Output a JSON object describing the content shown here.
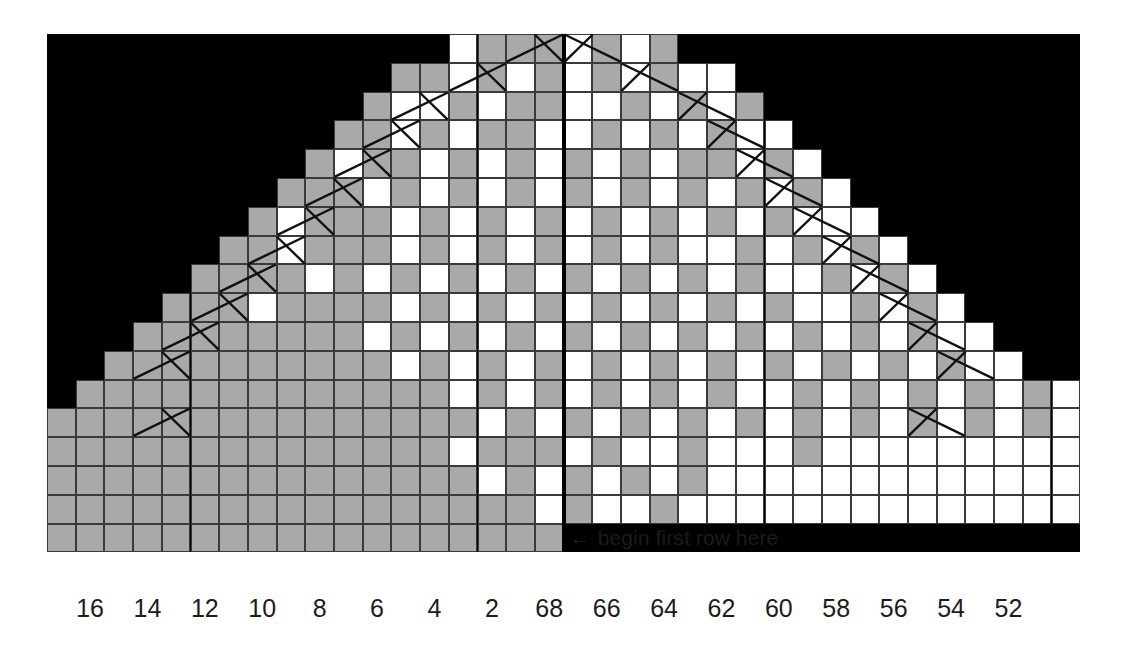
{
  "chart": {
    "type": "knitting-chart",
    "note": "begin first row here",
    "note_arrow": "←",
    "colors": {
      "background": "#000000",
      "page": "#ffffff",
      "shaded_stitch": "#a9a9a9",
      "plain_stitch": "#ffffff",
      "gridline": "#3a3a3a",
      "center_line": "#000000",
      "text": "#1c1c1c"
    },
    "geometry": {
      "left": 47,
      "top": 34,
      "cell_w": 28.7,
      "cell_h": 28.8,
      "cols": 36,
      "rows": 18,
      "center_col": 18
    },
    "column_labels": [
      {
        "text": "16",
        "col": 1
      },
      {
        "text": "14",
        "col": 3
      },
      {
        "text": "12",
        "col": 5
      },
      {
        "text": "10",
        "col": 7
      },
      {
        "text": "8",
        "col": 9
      },
      {
        "text": "6",
        "col": 11
      },
      {
        "text": "4",
        "col": 13
      },
      {
        "text": "2",
        "col": 15
      },
      {
        "text": "68",
        "col": 17
      },
      {
        "text": "66",
        "col": 19
      },
      {
        "text": "64",
        "col": 21
      },
      {
        "text": "62",
        "col": 23
      },
      {
        "text": "60",
        "col": 25
      },
      {
        "text": "58",
        "col": 27
      },
      {
        "text": "56",
        "col": 29
      },
      {
        "text": "54",
        "col": 31
      },
      {
        "text": "52",
        "col": 33
      }
    ],
    "legend_keys": {
      "shaded": "purl / colour A stitch",
      "plain": "knit / colour B stitch",
      "chevron": "double decrease"
    },
    "rows": [
      {
        "r": 0,
        "start": 14,
        "end": 22,
        "pattern": "wgggwgwg"
      },
      {
        "r": 1,
        "start": 12,
        "end": 24,
        "pattern": "ggwgwgwgwgww"
      },
      {
        "r": 2,
        "start": 11,
        "end": 25,
        "pattern": "gwwgwggwwgwgwg"
      },
      {
        "r": 3,
        "start": 10,
        "end": 26,
        "pattern": "ggwgwggwwgwgwgww"
      },
      {
        "r": 4,
        "start": 9,
        "end": 27,
        "pattern": "gwggwgwgwgwgwggwgw"
      },
      {
        "r": 5,
        "start": 8,
        "end": 28,
        "pattern": "gggwgwgwgwgwgwgwgwgw"
      },
      {
        "r": 6,
        "start": 7,
        "end": 29,
        "pattern": "gwgggwgwgwgwgwgwgwgwww"
      },
      {
        "r": 7,
        "start": 6,
        "end": 30,
        "pattern": "ggwgggwgwgwgwgwgwwgwgwgw"
      },
      {
        "r": 8,
        "start": 5,
        "end": 31,
        "pattern": "ggggwgwgwgwgwgwgwgwgwwgwgw"
      },
      {
        "r": 9,
        "start": 4,
        "end": 32,
        "pattern": "gggwggggwgwgwgwgwgwgwgwwgwgw"
      },
      {
        "r": 10,
        "start": 3,
        "end": 33,
        "pattern": "ggggggggwgwgwgwgwgwgwgwgwgwgww"
      },
      {
        "r": 11,
        "start": 2,
        "end": 34,
        "pattern": "ggggggggggwgwgwgwgwgwgwgwgwgwgww"
      },
      {
        "r": 12,
        "start": 1,
        "end": 35,
        "pattern": "gggggggggggggwgwgwgwgwgwwgwgwgwgwgw"
      },
      {
        "r": 13,
        "start": 0,
        "end": 36,
        "pattern": "gggggggggggggggwgwgwgwgwgwgwgwgwgwgw"
      },
      {
        "r": 14,
        "start": 0,
        "end": 36,
        "pattern": "ggggggggggggggwgggwgwwgwwwgwwwwwwwww"
      },
      {
        "r": 15,
        "start": 0,
        "end": 36,
        "pattern": "gggggggggggggggwgwgwgwgwwwwwwwwwwwww"
      },
      {
        "r": 16,
        "start": 0,
        "end": 36,
        "pattern": "gggggggggggggggggwgwwgwwwwwwwwwwwwww"
      },
      {
        "r": 17,
        "start": 0,
        "end": 18,
        "pattern": "gggggggggggggggggg"
      }
    ],
    "decreases": [
      {
        "r": 0,
        "c": 17,
        "dir": "left"
      },
      {
        "r": 0,
        "c": 18,
        "dir": "right"
      },
      {
        "r": 1,
        "c": 15,
        "dir": "left"
      },
      {
        "r": 1,
        "c": 20,
        "dir": "right"
      },
      {
        "r": 2,
        "c": 13,
        "dir": "left"
      },
      {
        "r": 2,
        "c": 22,
        "dir": "right"
      },
      {
        "r": 3,
        "c": 12,
        "dir": "left"
      },
      {
        "r": 3,
        "c": 23,
        "dir": "right"
      },
      {
        "r": 4,
        "c": 11,
        "dir": "left"
      },
      {
        "r": 4,
        "c": 24,
        "dir": "right"
      },
      {
        "r": 5,
        "c": 10,
        "dir": "left"
      },
      {
        "r": 5,
        "c": 25,
        "dir": "right"
      },
      {
        "r": 6,
        "c": 9,
        "dir": "left"
      },
      {
        "r": 6,
        "c": 26,
        "dir": "right"
      },
      {
        "r": 7,
        "c": 8,
        "dir": "left"
      },
      {
        "r": 7,
        "c": 27,
        "dir": "right"
      },
      {
        "r": 8,
        "c": 7,
        "dir": "left"
      },
      {
        "r": 8,
        "c": 28,
        "dir": "right"
      },
      {
        "r": 9,
        "c": 6,
        "dir": "left"
      },
      {
        "r": 9,
        "c": 29,
        "dir": "right"
      },
      {
        "r": 10,
        "c": 5,
        "dir": "left"
      },
      {
        "r": 10,
        "c": 30,
        "dir": "right"
      },
      {
        "r": 11,
        "c": 4,
        "dir": "left"
      },
      {
        "r": 11,
        "c": 31,
        "dir": "right"
      },
      {
        "r": 13,
        "c": 4,
        "dir": "left"
      },
      {
        "r": 13,
        "c": 30,
        "dir": "right"
      }
    ]
  }
}
